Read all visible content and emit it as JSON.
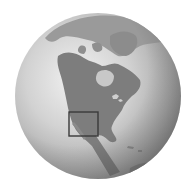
{
  "map": {
    "type": "orthographic-globe-locator",
    "region_shown": "North America",
    "highlight": {
      "label": "locator-box",
      "area": "Southern California / Baja California",
      "box": {
        "x": 69,
        "y": 112,
        "w": 29,
        "h": 24
      }
    },
    "colors": {
      "background": "#ffffff",
      "ocean_light": "#e8e8e8",
      "ocean_dark": "#8c8c8c",
      "land": "#7a7a7a",
      "land_light": "#a5a5a5",
      "box_stroke": "#3a3a3a"
    },
    "globe": {
      "cx": 98,
      "cy": 96,
      "r": 83
    }
  }
}
